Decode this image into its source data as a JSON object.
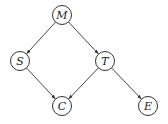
{
  "diagram": {
    "type": "directed-graph",
    "node_radius": 9.5,
    "colors": {
      "stroke": "#333333",
      "fill": "#ffffff",
      "text": "#222222"
    },
    "nodes": [
      {
        "id": "M",
        "label": "M",
        "x": 62,
        "y": 15
      },
      {
        "id": "S",
        "label": "S",
        "x": 20,
        "y": 61
      },
      {
        "id": "T",
        "label": "T",
        "x": 105,
        "y": 61
      },
      {
        "id": "C",
        "label": "C",
        "x": 62,
        "y": 106
      },
      {
        "id": "E",
        "label": "E",
        "x": 148,
        "y": 106
      }
    ],
    "edges": [
      {
        "from": "M",
        "to": "S"
      },
      {
        "from": "M",
        "to": "T"
      },
      {
        "from": "S",
        "to": "C"
      },
      {
        "from": "T",
        "to": "C"
      },
      {
        "from": "T",
        "to": "E"
      }
    ]
  }
}
